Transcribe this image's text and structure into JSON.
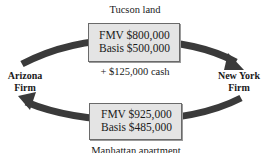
{
  "diagram": {
    "top_asset": {
      "caption": "Tucson land",
      "fmv": "FMV $800,000",
      "basis": "Basis $500,000",
      "boot": "+ $125,000 cash"
    },
    "bottom_asset": {
      "caption": "Manhattan apartment",
      "fmv": "FMV $925,000",
      "basis": "Basis $485,000"
    },
    "parties": {
      "left": {
        "line1": "Arizona",
        "line2": "Firm"
      },
      "right": {
        "line1": "New York",
        "line2": "Firm"
      }
    },
    "colors": {
      "arrow": "#3a3a3a",
      "box_fill": "#e4e4e4",
      "box_border": "#6a6a6a"
    }
  }
}
